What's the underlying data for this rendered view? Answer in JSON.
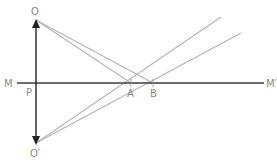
{
  "diagram": {
    "type": "ray-optics-mirror-image",
    "points": {
      "O": "O",
      "O_prime": "O′",
      "M": "M",
      "M_prime": "M′",
      "P": "P",
      "A": "A",
      "B": "B"
    },
    "colors": {
      "rays": "#b4b4b4",
      "mirror_line": "#3c3c3c",
      "object_arrow": "#222222",
      "labels": "#8a8a8a"
    }
  }
}
